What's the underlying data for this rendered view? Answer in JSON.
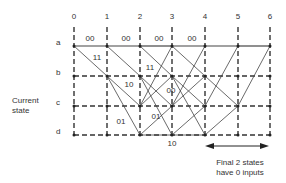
{
  "diagram": {
    "type": "trellis",
    "side_label": [
      "Current",
      "state"
    ],
    "columns": [
      "0",
      "1",
      "2",
      "3",
      "4",
      "5",
      "6"
    ],
    "rows": [
      "a",
      "b",
      "c",
      "d"
    ],
    "edge_labels": [
      {
        "text": "00",
        "x": 90,
        "y": 39
      },
      {
        "text": "00",
        "x": 126,
        "y": 39
      },
      {
        "text": "00",
        "x": 159,
        "y": 39
      },
      {
        "text": "00",
        "x": 192,
        "y": 39
      },
      {
        "text": "11",
        "x": 97,
        "y": 58
      },
      {
        "text": "11",
        "x": 150,
        "y": 68
      },
      {
        "text": "10",
        "x": 129,
        "y": 85
      },
      {
        "text": "00",
        "x": 171,
        "y": 91
      },
      {
        "text": "01",
        "x": 121,
        "y": 122
      },
      {
        "text": "01",
        "x": 156,
        "y": 117
      },
      {
        "text": "10",
        "x": 172,
        "y": 144
      }
    ],
    "note": [
      "Final 2 states",
      "have 0 inputs"
    ],
    "line_color": "#333333"
  }
}
